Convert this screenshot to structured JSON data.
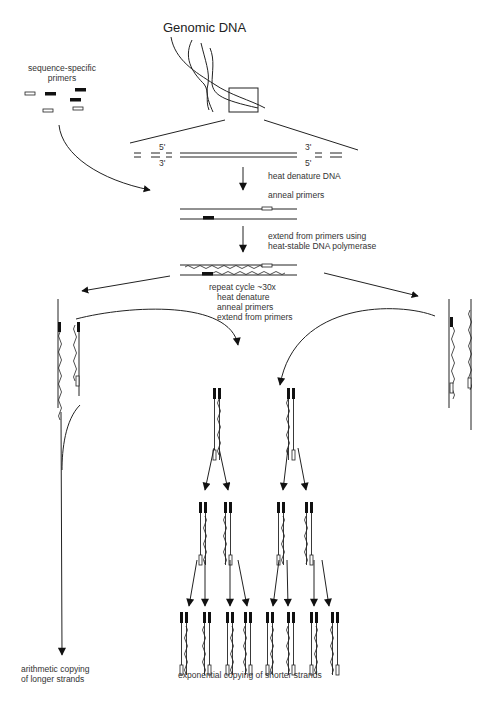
{
  "diagram": {
    "title": "Genomic DNA",
    "primers_label_line1": "sequence-specific",
    "primers_label_line2": "primers",
    "end_labels": {
      "top_left": "5'",
      "bottom_left": "3'",
      "top_right": "3'",
      "bottom_right": "5'"
    },
    "steps": {
      "denature": "heat denature DNA",
      "anneal": "anneal primers",
      "extend_line1": "extend from primers using",
      "extend_line2": "heat-stable DNA polymerase"
    },
    "repeat_cycle": {
      "line1": "repeat cycle ~30x",
      "line2": "heat denature",
      "line3": "anneal primers",
      "line4": "extend from primers"
    },
    "outcomes": {
      "arithmetic_line1": "arithmetic copying",
      "arithmetic_line2": "of  longer strands",
      "exponential": "exponential copying of shorter strands"
    },
    "colors": {
      "stroke": "#222222",
      "text": "#333333",
      "background": "#ffffff",
      "primer_fill": "#111111"
    }
  }
}
